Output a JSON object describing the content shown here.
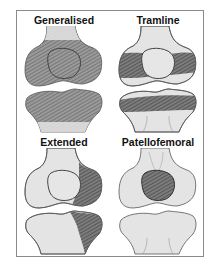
{
  "figure": {
    "panels": [
      {
        "id": "generalised",
        "title": "Generalised",
        "pattern": "whole joint hatched (femur, patella, tibia)"
      },
      {
        "id": "tramline",
        "title": "Tramline",
        "pattern": "horizontal bands across femoral condyles and tibial plateau"
      },
      {
        "id": "extended",
        "title": "Extended",
        "pattern": "lateral femoral condyle and lateral tibia hatched"
      },
      {
        "id": "patellofemoral",
        "title": "Patellofemoral",
        "pattern": "patella hatched only"
      }
    ]
  },
  "colors": {
    "bone_fill": "#e4e4e4",
    "bone_outline": "#555555",
    "hatch_fill": "#8f8f8f",
    "hatch_line": "#5e5e5e",
    "frame_border": "#8a8a8a",
    "title_text": "#111111"
  }
}
